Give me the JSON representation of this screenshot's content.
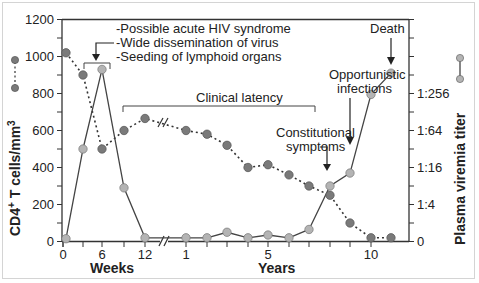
{
  "chart_data": {
    "type": "line",
    "title": "",
    "xlabel_weeks": "Weeks",
    "xlabel_years": "Years",
    "ylabel_left": "CD4+ T cells/mm3",
    "ylabel_right": "Plasma viremia titer",
    "ylim_left": [
      0,
      1200
    ],
    "left_ticks": [
      "0",
      "200",
      "400",
      "600",
      "800",
      "1000",
      "1200"
    ],
    "right_ticks": [
      "0",
      "1:4",
      "1:16",
      "1:64",
      "1:256"
    ],
    "x_tick_labels": [
      "0",
      "6",
      "12",
      "1",
      "5",
      "10"
    ],
    "grid": false,
    "x": [
      "0 wk",
      "3 wk",
      "6 wk",
      "9 wk",
      "12 wk",
      "1 yr",
      "2 yr",
      "3 yr",
      "4 yr",
      "5 yr",
      "6 yr",
      "7 yr",
      "8 yr",
      "9 yr",
      "10 yr",
      "11 yr"
    ],
    "series": [
      {
        "name": "CD4+ T cells/mm3",
        "style": "dotted",
        "values": [
          1020,
          900,
          500,
          600,
          665,
          600,
          580,
          520,
          400,
          415,
          360,
          300,
          250,
          100,
          20,
          20
        ]
      },
      {
        "name": "Plasma viremia titer (left-axis scale equivalent)",
        "style": "solid",
        "values": [
          15,
          500,
          930,
          290,
          20,
          20,
          20,
          50,
          20,
          35,
          20,
          65,
          300,
          370,
          795,
          910
        ]
      }
    ],
    "annotations": [
      "-Possible acute HIV syndrome",
      "-Wide dissemination of virus",
      "-Seeding of lymphoid organs",
      "Clinical latency",
      "Constitutional symptoms",
      "Opportunistic infections",
      "Death"
    ]
  },
  "labels": {
    "acute1": "-Possible acute HIV syndrome",
    "acute2": "-Wide dissemination of virus",
    "acute3": "-Seeding of lymphoid organs",
    "latency": "Clinical latency",
    "const1": "Constitutional",
    "const2": "symptoms",
    "opp1": "Opportunistic",
    "opp2": "infections",
    "death": "Death",
    "weeks": "Weeks",
    "years": "Years",
    "ylabel_left": "CD4+ T cells/mm3",
    "ylabel_right": "Plasma viremia titer"
  },
  "colors": {
    "cd4_marker": "#7a7a7a",
    "viremia_marker": "#b4b4b4",
    "line": "#333333"
  }
}
